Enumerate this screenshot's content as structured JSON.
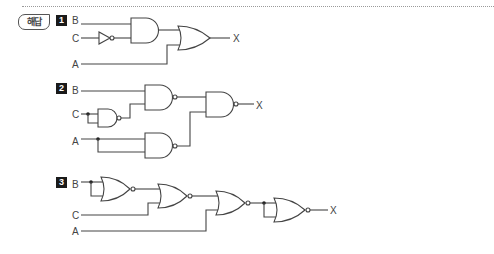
{
  "header": {
    "badge_label": "해답"
  },
  "circuits": [
    {
      "number": "1",
      "inputs": [
        "B",
        "C",
        "A"
      ],
      "gates": [
        "NOT",
        "AND",
        "OR"
      ],
      "output": "X"
    },
    {
      "number": "2",
      "inputs": [
        "B",
        "C",
        "A"
      ],
      "gates": [
        "NAND",
        "NAND",
        "NAND",
        "NAND"
      ],
      "output": "X"
    },
    {
      "number": "3",
      "inputs": [
        "B",
        "C",
        "A"
      ],
      "gates": [
        "NOR",
        "NOR",
        "NOR",
        "NOR"
      ],
      "output": "X"
    }
  ],
  "colors": {
    "line": "#444444",
    "badge_bg": "#1a1a1a"
  }
}
